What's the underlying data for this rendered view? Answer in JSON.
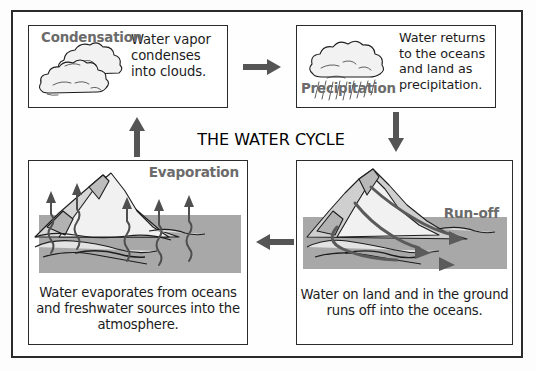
{
  "diagram": {
    "title": "THE WATER CYCLE",
    "colors": {
      "frame": "#2b2b2b",
      "panel_border": "#2b2b2b",
      "label_gray": "#6b6b6b",
      "title_gray": "#545454",
      "arrow_gray": "#555555",
      "ocean_gray": "#a8a8a8",
      "mountain_light": "#f0f0f0",
      "mountain_mid": "#cfcfcf",
      "mountain_dark": "#a5a5a5",
      "cloud_fill": "#f2f2f2",
      "body_text": "#1c1c1c"
    }
  },
  "panels": {
    "condensation": {
      "label": "Condensation",
      "text": "Water vapor condenses into clouds.",
      "art": "cloud-illustration"
    },
    "precipitation": {
      "label": "Precipitation",
      "text": "Water returns to the oceans and land as precipitation.",
      "art": "raincloud-illustration"
    },
    "evaporation": {
      "label": "Evaporation",
      "caption": "Water evaporates from oceans and freshwater sources into the atmosphere.",
      "art": "mountain-ocean-evaporation-illustration"
    },
    "runoff": {
      "label": "Run-off",
      "caption": "Water on land and in the ground runs off into the oceans.",
      "art": "mountain-ocean-runoff-illustration"
    }
  },
  "arrows": [
    {
      "name": "condensation-to-precipitation",
      "direction": "right"
    },
    {
      "name": "precipitation-to-runoff",
      "direction": "down"
    },
    {
      "name": "runoff-to-evaporation",
      "direction": "left"
    },
    {
      "name": "evaporation-to-condensation",
      "direction": "up"
    }
  ]
}
